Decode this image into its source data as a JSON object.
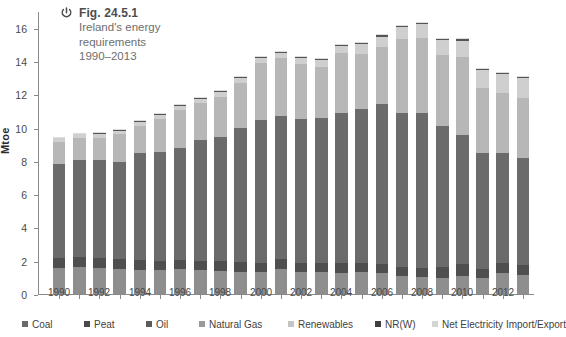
{
  "figure": {
    "icon_name": "power-symbol-icon",
    "number": "Fig. 24.5.1",
    "subtitle_lines": [
      "Ireland's energy",
      "requirements",
      "1990–2013"
    ]
  },
  "chart_data": {
    "type": "bar",
    "stacked": true,
    "title": "Ireland's energy requirements 1990–2013",
    "xlabel": "",
    "ylabel": "Mtoe",
    "ylim": [
      0,
      17
    ],
    "ytick_values": [
      0,
      2,
      4,
      6,
      8,
      10,
      12,
      14,
      16
    ],
    "ytick_labels": [
      "0",
      "2",
      "4",
      "6",
      "8",
      "10",
      "12",
      "14",
      "16"
    ],
    "grid": false,
    "legend_position": "bottom",
    "categories": [
      "1990",
      "1991",
      "1992",
      "1993",
      "1994",
      "1995",
      "1996",
      "1997",
      "1998",
      "1999",
      "2000",
      "2001",
      "2002",
      "2003",
      "2004",
      "2005",
      "2006",
      "2007",
      "2008",
      "2009",
      "2010",
      "2011",
      "2012",
      "2013"
    ],
    "xtick_labels": [
      "1990",
      "1992",
      "1994",
      "1996",
      "1998",
      "2000",
      "2002",
      "2004",
      "2006",
      "2008",
      "2010",
      "2012"
    ],
    "series": [
      {
        "name": "Coal",
        "color": "#8e8e8e",
        "values": [
          1.55,
          1.6,
          1.55,
          1.5,
          1.45,
          1.45,
          1.5,
          1.45,
          1.4,
          1.35,
          1.3,
          1.5,
          1.3,
          1.3,
          1.25,
          1.3,
          1.25,
          1.1,
          1.0,
          0.95,
          1.1,
          0.95,
          1.25,
          1.15
        ]
      },
      {
        "name": "Peat",
        "color": "#4f4f4f",
        "values": [
          0.6,
          0.6,
          0.6,
          0.6,
          0.6,
          0.55,
          0.55,
          0.55,
          0.6,
          0.55,
          0.55,
          0.6,
          0.55,
          0.55,
          0.6,
          0.55,
          0.55,
          0.55,
          0.55,
          0.65,
          0.7,
          0.55,
          0.6,
          0.6
        ]
      },
      {
        "name": "Oil",
        "color": "#6b6b6b",
        "values": [
          5.65,
          5.85,
          5.9,
          5.85,
          6.45,
          6.55,
          6.7,
          7.25,
          7.45,
          8.05,
          8.6,
          8.6,
          8.65,
          8.7,
          9.0,
          9.25,
          9.6,
          9.25,
          9.3,
          8.5,
          7.75,
          7.0,
          6.65,
          6.45
        ]
      },
      {
        "name": "Natural Gas",
        "color": "#b7b7b7",
        "values": [
          1.35,
          1.35,
          1.35,
          1.65,
          1.6,
          1.95,
          2.3,
          2.2,
          2.4,
          2.75,
          3.4,
          3.45,
          3.3,
          3.1,
          3.6,
          3.35,
          3.45,
          4.4,
          4.55,
          4.25,
          4.7,
          3.9,
          3.6,
          3.55
        ]
      },
      {
        "name": "Renewables",
        "color": "#cfcfcf",
        "values": [
          0.2,
          0.2,
          0.22,
          0.22,
          0.24,
          0.25,
          0.26,
          0.27,
          0.28,
          0.3,
          0.32,
          0.34,
          0.36,
          0.42,
          0.48,
          0.55,
          0.62,
          0.72,
          0.82,
          0.9,
          0.98,
          1.05,
          1.1,
          1.2
        ]
      },
      {
        "name": "NR(W)",
        "color": "#555555",
        "values": [
          0.04,
          0.04,
          0.04,
          0.04,
          0.04,
          0.05,
          0.05,
          0.05,
          0.05,
          0.05,
          0.05,
          0.06,
          0.06,
          0.06,
          0.06,
          0.07,
          0.07,
          0.07,
          0.07,
          0.07,
          0.07,
          0.08,
          0.08,
          0.08
        ]
      },
      {
        "name": "Net Electricity Import/Export",
        "color": "#dcdcdc",
        "values": [
          0.06,
          0.06,
          0.06,
          0.06,
          0.06,
          0.06,
          0.06,
          0.06,
          0.06,
          0.06,
          0.06,
          0.06,
          0.06,
          0.06,
          0.06,
          0.06,
          0.06,
          0.06,
          0.06,
          0.06,
          0.06,
          0.06,
          0.06,
          0.06
        ]
      }
    ],
    "totals": [
      9.45,
      9.7,
      9.72,
      9.92,
      10.44,
      10.86,
      11.42,
      11.83,
      12.24,
      13.11,
      14.28,
      14.61,
      14.28,
      14.19,
      15.05,
      15.13,
      15.6,
      16.15,
      16.36,
      15.38,
      15.36,
      13.59,
      13.34,
      13.09
    ]
  },
  "legend": {
    "items": [
      {
        "label": "Coal",
        "color": "#6b6b6b",
        "left": 22
      },
      {
        "label": "Peat",
        "color": "#4a4a4a",
        "left": 84
      },
      {
        "label": "Oil",
        "color": "#5c5c5c",
        "left": 146
      },
      {
        "label": "Natural Gas",
        "color": "#9a9a9a",
        "left": 199
      },
      {
        "label": "Renewables",
        "color": "#c4c4c4",
        "left": 288
      },
      {
        "label": "NR(W)",
        "color": "#3f3f3f",
        "left": 375
      },
      {
        "label": "Net Electricity Import/Export",
        "color": "#d5d5d5",
        "left": 432
      }
    ]
  }
}
